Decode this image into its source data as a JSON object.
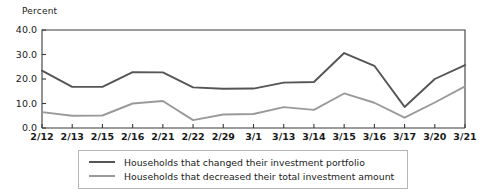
{
  "chart_data": {
    "type": "line",
    "title": "",
    "xlabel": "",
    "ylabel": "Percent",
    "ylim": [
      0.0,
      40.0
    ],
    "ytick_labels": [
      "0.0",
      "10.0",
      "20.0",
      "30.0",
      "40.0"
    ],
    "ytick_values": [
      0.0,
      10.0,
      20.0,
      30.0,
      40.0
    ],
    "grid": false,
    "legend_position": "bottom-center",
    "categories": [
      "2/12",
      "2/13",
      "2/15",
      "2/16",
      "2/21",
      "2/22",
      "2/29",
      "3/1",
      "3/13",
      "3/14",
      "3/15",
      "3/16",
      "3/17",
      "3/20",
      "3/21"
    ],
    "series": [
      {
        "name": "Households that changed their investment portfolio",
        "color": "#555555",
        "values": [
          23.4,
          16.8,
          16.8,
          22.8,
          22.7,
          16.6,
          16.0,
          16.1,
          18.5,
          18.8,
          30.6,
          25.4,
          8.6,
          20.0,
          25.7
        ]
      },
      {
        "name": "Households that decreased their total investment amount",
        "color": "#9a9a9a",
        "values": [
          6.5,
          5.0,
          5.1,
          10.0,
          11.0,
          3.2,
          5.5,
          5.7,
          8.5,
          7.4,
          14.1,
          10.3,
          4.2,
          10.4,
          17.0
        ]
      }
    ]
  },
  "legend": {
    "items": [
      {
        "label": "Households that changed their investment portfolio",
        "color": "#555555"
      },
      {
        "label": "Households that decreased their total investment amount",
        "color": "#9a9a9a"
      }
    ]
  }
}
